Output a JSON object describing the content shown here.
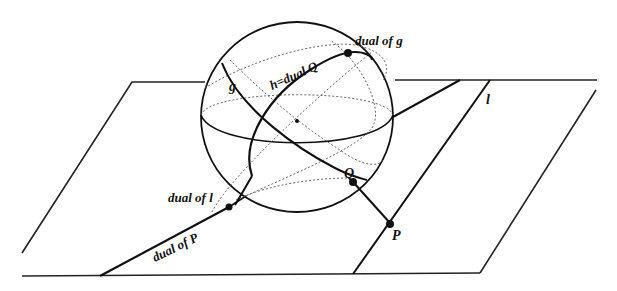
{
  "diagram": {
    "type": "geometric-figure",
    "labels": {
      "g": "g",
      "h_dual_Q": "h=dual Q",
      "dual_of_g": "dual of g",
      "l": "l",
      "Q": "Q",
      "P": "P",
      "dual_of_l": "dual of l",
      "dual_of_P": "dual of P"
    },
    "colors": {
      "stroke": "#111111",
      "dotted": "#555555",
      "background": "#ffffff"
    }
  }
}
